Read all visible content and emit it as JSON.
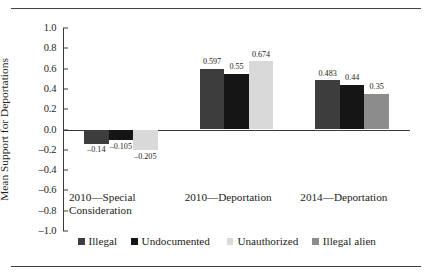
{
  "chart_data": {
    "type": "bar",
    "title": "",
    "subtitle": "",
    "xlabel": "",
    "ylabel": "Mean Support for Deportations",
    "ylim": [
      -1.0,
      1.0
    ],
    "ytick_labels": [
      "1.0",
      "0.8",
      "0.6",
      "0.4",
      "0.2",
      "0.0",
      "-0.2",
      "-0.4",
      "-0.6",
      "-0.8",
      "-1.0"
    ],
    "ytick_values": [
      1.0,
      0.8,
      0.6,
      0.4,
      0.2,
      0.0,
      -0.2,
      -0.4,
      -0.6,
      -0.8,
      -1.0
    ],
    "grid": false,
    "legend_position": "bottom",
    "categories": [
      "2010—Special Consideration",
      "2010—Deportation",
      "2014—Deportation"
    ],
    "series": [
      {
        "name": "Illegal",
        "color": "#3d3d3d",
        "values": [
          -0.14,
          0.597,
          0.483
        ],
        "labels": [
          "-0.14",
          "0.597",
          "0.483"
        ]
      },
      {
        "name": "Undocumented",
        "color": "#151515",
        "values": [
          -0.105,
          0.55,
          0.44
        ],
        "labels": [
          "-0.105",
          "0.55",
          "0.44"
        ]
      },
      {
        "name": "Unauthorized",
        "color": "#d9d9d9",
        "values": [
          -0.205,
          0.674,
          null
        ],
        "labels": [
          "-0.205",
          "0.674",
          ""
        ]
      },
      {
        "name": "Illegal alien",
        "color": "#8c8c8c",
        "values": [
          null,
          null,
          0.35
        ],
        "labels": [
          "",
          "",
          "0.35"
        ]
      }
    ]
  },
  "legend": {
    "items": [
      {
        "label": "Illegal",
        "color": "#3d3d3d"
      },
      {
        "label": "Undocumented",
        "color": "#151515"
      },
      {
        "label": "Unauthorized",
        "color": "#d9d9d9"
      },
      {
        "label": "Illegal alien",
        "color": "#8c8c8c"
      }
    ]
  },
  "axis": {
    "y_title": "Mean Support for Deportations",
    "ticks": [
      "1.0",
      "0.8",
      "0.6",
      "0.4",
      "0.2",
      "0.0",
      "-0.2",
      "-0.4",
      "-0.6",
      "-0.8",
      "-1.0"
    ]
  },
  "groups": [
    {
      "label": "2010—Special\nConsideration"
    },
    {
      "label": "2010—Deportation"
    },
    {
      "label": "2014—Deportation"
    }
  ]
}
